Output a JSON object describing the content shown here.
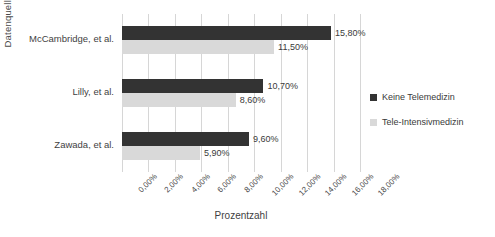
{
  "chart_data": {
    "type": "bar",
    "orientation": "horizontal",
    "title": "",
    "xlabel": "Prozentzahl",
    "ylabel": "Datenquelle",
    "categories": [
      "McCambridge, et al.",
      "Lilly, et al.",
      "Zawada, et al."
    ],
    "series": [
      {
        "name": "Keine Telemedizin",
        "color": "#333333",
        "values": [
          15.8,
          10.7,
          9.6
        ],
        "labels": [
          "15,80%",
          "10,70%",
          "9,60%"
        ]
      },
      {
        "name": "Tele-Intensivmedizin",
        "color": "#d9d9d9",
        "values": [
          11.5,
          8.6,
          5.9
        ],
        "labels": [
          "11,50%",
          "8,60%",
          "5,90%"
        ]
      }
    ],
    "xlim": [
      0,
      18
    ],
    "xticks": [
      0,
      2,
      4,
      6,
      8,
      10,
      12,
      14,
      16,
      18
    ],
    "xtick_labels": [
      "0,00%",
      "2,00%",
      "4,00%",
      "6,00%",
      "8,00%",
      "10,00%",
      "12,00%",
      "14,00%",
      "16,00%",
      "18,00%"
    ],
    "grid": true,
    "grid_axis": "x",
    "legend_position": "right"
  }
}
